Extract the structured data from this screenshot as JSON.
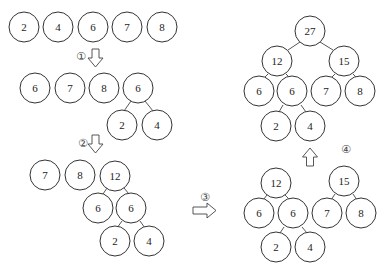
{
  "steps": [
    {
      "label": "①"
    },
    {
      "label": "②"
    },
    {
      "label": "③"
    },
    {
      "label": "④"
    }
  ],
  "stage0": {
    "nodes": [
      "2",
      "4",
      "6",
      "7",
      "8"
    ]
  },
  "stage1": {
    "nodes": [
      "6",
      "7",
      "8",
      "6",
      "2",
      "4"
    ]
  },
  "stage2": {
    "nodes": [
      "7",
      "8",
      "12",
      "6",
      "6",
      "2",
      "4"
    ]
  },
  "stage3": {
    "nodes": [
      "12",
      "6",
      "6",
      "2",
      "4",
      "15",
      "7",
      "8"
    ]
  },
  "stage4": {
    "nodes": [
      "27",
      "12",
      "15",
      "6",
      "6",
      "7",
      "8",
      "2",
      "4"
    ]
  }
}
